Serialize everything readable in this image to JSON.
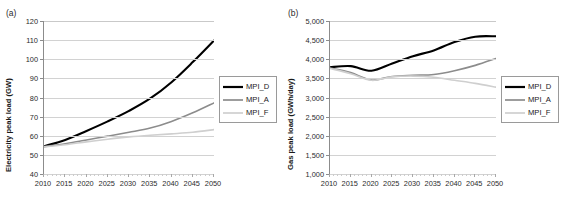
{
  "figure": {
    "panels": [
      {
        "label": "(a)",
        "ylabel": "Electricity peak load (GW)",
        "legend": [
          {
            "name": "MPI_D",
            "color": "#000000",
            "width": 2.2
          },
          {
            "name": "MPI_A",
            "color": "#8c8c8c",
            "width": 1.7
          },
          {
            "name": "MPI_F",
            "color": "#cfcfcf",
            "width": 1.7
          }
        ]
      },
      {
        "label": "(b)",
        "ylabel": "Gas peak load (GWh/day)",
        "legend": [
          {
            "name": "MPI_D",
            "color": "#000000",
            "width": 2.2
          },
          {
            "name": "MPI_A",
            "color": "#8c8c8c",
            "width": 1.7
          },
          {
            "name": "MPI_F",
            "color": "#cfcfcf",
            "width": 1.7
          }
        ]
      }
    ]
  },
  "chart_data": [
    {
      "type": "line",
      "title": "(a)",
      "xlabel": "",
      "ylabel": "Electricity peak load (GW)",
      "x": [
        2010,
        2015,
        2020,
        2025,
        2030,
        2035,
        2040,
        2045,
        2050
      ],
      "xlim": [
        2010,
        2050
      ],
      "ylim": [
        40,
        120
      ],
      "yticks": [
        40,
        50,
        60,
        70,
        80,
        90,
        100,
        110,
        120
      ],
      "ytick_labels": [
        "40",
        "50",
        "60",
        "70",
        "80",
        "90",
        "100",
        "110",
        "120"
      ],
      "xticks": [
        2010,
        2015,
        2020,
        2025,
        2030,
        2035,
        2040,
        2045,
        2050
      ],
      "xtick_labels": [
        "2010",
        "2015",
        "2020",
        "2025",
        "2030",
        "2035",
        "2040",
        "2045",
        "2050"
      ],
      "grid": true,
      "legend_position": "right",
      "series": [
        {
          "name": "MPI_D",
          "color": "#000000",
          "values": [
            54.5,
            57.8,
            62.5,
            67.5,
            73.0,
            79.5,
            88.0,
            98.5,
            109.8
          ]
        },
        {
          "name": "MPI_A",
          "color": "#8c8c8c",
          "values": [
            54.3,
            55.8,
            57.8,
            59.8,
            61.8,
            64.0,
            67.5,
            72.0,
            77.2
          ]
        },
        {
          "name": "MPI_F",
          "color": "#cfcfcf",
          "values": [
            54.2,
            55.3,
            56.8,
            58.2,
            59.4,
            60.3,
            61.0,
            61.8,
            63.2
          ]
        }
      ]
    },
    {
      "type": "line",
      "title": "(b)",
      "xlabel": "",
      "ylabel": "Gas peak load (GWh/day)",
      "x": [
        2010,
        2015,
        2020,
        2025,
        2030,
        2035,
        2040,
        2045,
        2050
      ],
      "xlim": [
        2010,
        2050
      ],
      "ylim": [
        1000,
        5000
      ],
      "yticks": [
        1000,
        1500,
        2000,
        2500,
        3000,
        3500,
        4000,
        4500,
        5000
      ],
      "ytick_labels": [
        "1,000",
        "1,500",
        "2,000",
        "2,500",
        "3,000",
        "3,500",
        "4,000",
        "4,500",
        "5,000"
      ],
      "xticks": [
        2010,
        2015,
        2020,
        2025,
        2030,
        2035,
        2040,
        2045,
        2050
      ],
      "xtick_labels": [
        "2010",
        "2015",
        "2020",
        "2025",
        "2030",
        "2035",
        "2040",
        "2045",
        "2050"
      ],
      "grid": true,
      "legend_position": "right",
      "series": [
        {
          "name": "MPI_D",
          "color": "#000000",
          "values": [
            3790,
            3820,
            3700,
            3890,
            4080,
            4230,
            4450,
            4590,
            4600
          ]
        },
        {
          "name": "MPI_A",
          "color": "#8c8c8c",
          "values": [
            3770,
            3650,
            3460,
            3550,
            3580,
            3600,
            3700,
            3840,
            4020
          ]
        },
        {
          "name": "MPI_F",
          "color": "#cfcfcf",
          "values": [
            3760,
            3620,
            3450,
            3540,
            3560,
            3530,
            3450,
            3370,
            3270
          ]
        }
      ]
    }
  ]
}
